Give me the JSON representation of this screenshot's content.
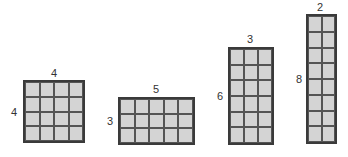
{
  "figure": {
    "rectangles": [
      {
        "name": "rect-4x4",
        "width_units": 4,
        "height_units": 4,
        "top_label": "4",
        "side_label": "4",
        "box": {
          "left": 23,
          "top": 80,
          "width": 62,
          "height": 63
        },
        "top_label_pos": {
          "left": 51,
          "top": 68
        },
        "side_label_pos": {
          "left": 11,
          "top": 107
        }
      },
      {
        "name": "rect-5x3",
        "width_units": 5,
        "height_units": 3,
        "top_label": "5",
        "side_label": "3",
        "box": {
          "left": 118,
          "top": 97,
          "width": 77,
          "height": 48
        },
        "top_label_pos": {
          "left": 153,
          "top": 84
        },
        "side_label_pos": {
          "left": 107,
          "top": 116
        }
      },
      {
        "name": "rect-3x6",
        "width_units": 3,
        "height_units": 6,
        "top_label": "3",
        "side_label": "6",
        "box": {
          "left": 228,
          "top": 47,
          "width": 46,
          "height": 98
        },
        "top_label_pos": {
          "left": 247,
          "top": 34
        },
        "side_label_pos": {
          "left": 217,
          "top": 91
        }
      },
      {
        "name": "rect-2x8",
        "width_units": 2,
        "height_units": 8,
        "top_label": "2",
        "side_label": "8",
        "box": {
          "left": 306,
          "top": 14,
          "width": 31,
          "height": 130
        },
        "top_label_pos": {
          "left": 317,
          "top": 2
        },
        "side_label_pos": {
          "left": 296,
          "top": 74
        }
      }
    ],
    "colors": {
      "fill": "#d4d4d4",
      "border": "#3a3a3a",
      "grid_line": "#555555",
      "label": "#333333"
    }
  }
}
